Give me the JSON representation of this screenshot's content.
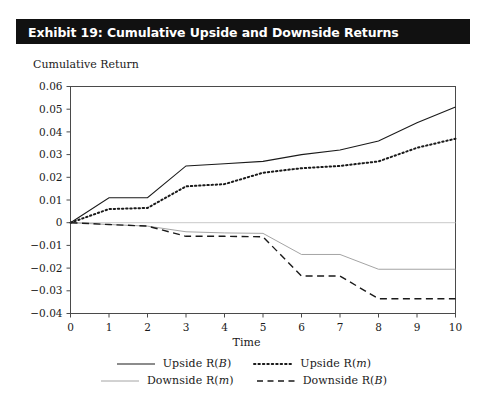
{
  "exhibit": {
    "title": "Exhibit 19: Cumulative Upside and Downside Returns"
  },
  "axes": {
    "y_caption": "Cumulative Return",
    "x_title": "Time"
  },
  "legend": {
    "rows": [
      [
        {
          "label_prefix": "Upside R(",
          "label_italic": "B",
          "label_suffix": ")",
          "style": "solid",
          "color": "#1a1a1a",
          "width": 1.1
        },
        {
          "label_prefix": "Upside R(",
          "label_italic": "m",
          "label_suffix": ")",
          "style": "dotted",
          "color": "#1a1a1a",
          "width": 2.0
        }
      ],
      [
        {
          "label_prefix": "Downside R(",
          "label_italic": "m",
          "label_suffix": ")",
          "style": "solid",
          "color": "#9a9a9a",
          "width": 0.9
        },
        {
          "label_prefix": "Downside R(",
          "label_italic": "B",
          "label_suffix": ")",
          "style": "dashed",
          "color": "#1a1a1a",
          "width": 1.4
        }
      ]
    ]
  },
  "chart_data": {
    "type": "line",
    "title": "Exhibit 19: Cumulative Upside and Downside Returns",
    "xlabel": "Time",
    "ylabel": "Cumulative Return",
    "xlim": [
      0,
      10
    ],
    "ylim": [
      -0.04,
      0.06
    ],
    "grid": false,
    "zero_line": true,
    "legend_position": "bottom",
    "x": [
      0,
      1,
      2,
      3,
      4,
      5,
      6,
      7,
      8,
      9,
      10
    ],
    "xticks": [
      0,
      1,
      2,
      3,
      4,
      5,
      6,
      7,
      8,
      9,
      10
    ],
    "xticklabels": [
      "0",
      "1",
      "2",
      "3",
      "4",
      "5",
      "6",
      "7",
      "8",
      "9",
      "10"
    ],
    "yticks": [
      -0.04,
      -0.03,
      -0.02,
      -0.01,
      0,
      0.01,
      0.02,
      0.03,
      0.04,
      0.05,
      0.06
    ],
    "yticklabels": [
      "−0.04",
      "−0.03",
      "−0.02",
      "−0.01",
      "0",
      "0.01",
      "0.02",
      "0.03",
      "0.04",
      "0.05",
      "0.06"
    ],
    "series": [
      {
        "name": "Upside R(B)",
        "style": "solid",
        "color": "#1a1a1a",
        "width": 1.1,
        "values": [
          0,
          0.011,
          0.011,
          0.025,
          0.026,
          0.027,
          0.03,
          0.032,
          0.036,
          0.044,
          0.051
        ]
      },
      {
        "name": "Upside R(m)",
        "style": "dotted",
        "color": "#1a1a1a",
        "width": 2.0,
        "values": [
          0,
          0.006,
          0.0065,
          0.016,
          0.017,
          0.022,
          0.024,
          0.025,
          0.027,
          0.033,
          0.037
        ]
      },
      {
        "name": "Downside R(m)",
        "style": "solid",
        "color": "#9a9a9a",
        "width": 0.9,
        "values": [
          0,
          -0.0008,
          -0.0015,
          -0.004,
          -0.0045,
          -0.0047,
          -0.014,
          -0.014,
          -0.0205,
          -0.0205,
          -0.0205
        ]
      },
      {
        "name": "Downside R(B)",
        "style": "dashed",
        "color": "#1a1a1a",
        "width": 1.4,
        "values": [
          0,
          -0.0008,
          -0.0015,
          -0.006,
          -0.006,
          -0.0062,
          -0.0235,
          -0.0235,
          -0.0335,
          -0.0335,
          -0.0335
        ]
      }
    ]
  }
}
